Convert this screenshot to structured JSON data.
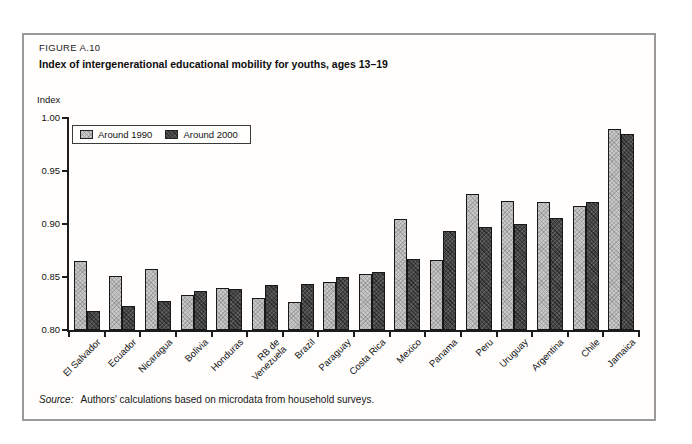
{
  "figure": {
    "label": "FIGURE A.10",
    "title": "Index of intergenerational educational mobility for youths, ages 13–19",
    "source_prefix": "Source:",
    "source_text": "Authors' calculations based on microdata from household surveys."
  },
  "chart_data": {
    "type": "bar",
    "title": "Index of intergenerational educational mobility for youths, ages 13–19",
    "xlabel": "",
    "ylabel": "Index",
    "ylim": [
      0.8,
      1.0
    ],
    "ytick_labels": [
      "1.00",
      "0.95",
      "0.90",
      "0.85",
      "0.80"
    ],
    "grid": false,
    "legend_position": "top-left",
    "categories": [
      "El Salvador",
      "Ecuador",
      "Nicaragua",
      "Bolivia",
      "Honduras",
      "RB de\nVenezuela",
      "Brazil",
      "Paraguay",
      "Costa Rica",
      "Mexico",
      "Panama",
      "Peru",
      "Uruguay",
      "Argentina",
      "Chile",
      "Jamaica"
    ],
    "series": [
      {
        "name": "Around 1990",
        "color": "#c8c8c8",
        "values": [
          0.865,
          0.851,
          0.858,
          0.833,
          0.84,
          0.83,
          0.826,
          0.845,
          0.853,
          0.905,
          0.866,
          0.928,
          0.922,
          0.921,
          0.917,
          0.99
        ]
      },
      {
        "name": "Around 2000",
        "color": "#474747",
        "values": [
          0.818,
          0.823,
          0.827,
          0.837,
          0.839,
          0.842,
          0.843,
          0.85,
          0.855,
          0.867,
          0.893,
          0.897,
          0.9,
          0.906,
          0.921,
          0.985
        ]
      }
    ]
  }
}
